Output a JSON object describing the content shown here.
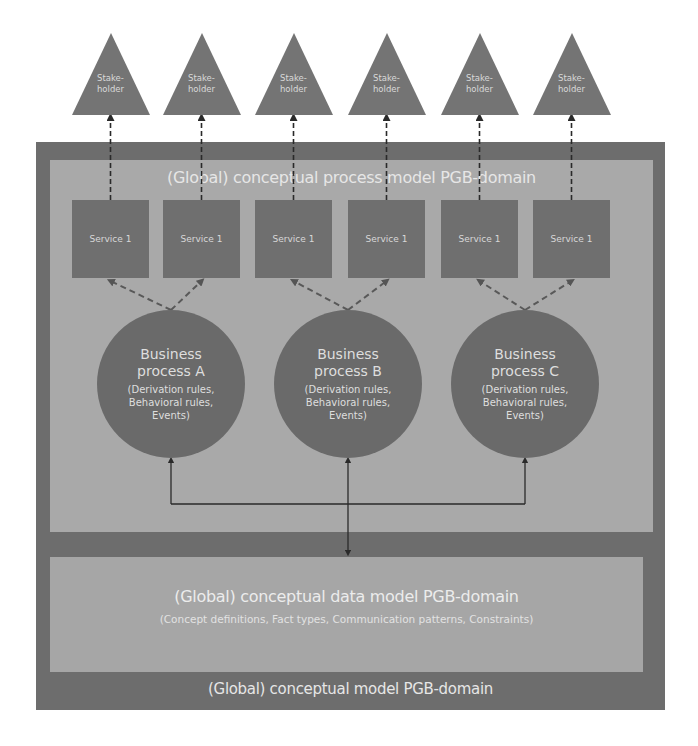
{
  "diagram": {
    "outer_model": {
      "title": "(Global) conceptual model PGB-domain"
    },
    "process_model": {
      "title": "(Global) conceptual process model PGB-domain"
    },
    "data_model": {
      "title": "(Global) conceptual data model PGB-domain",
      "subtitle": "(Concept definitions, Fact types, Communication patterns, Constraints)"
    },
    "stakeholders": [
      {
        "line1": "Stake-",
        "line2": "holder"
      },
      {
        "line1": "Stake-",
        "line2": "holder"
      },
      {
        "line1": "Stake-",
        "line2": "holder"
      },
      {
        "line1": "Stake-",
        "line2": "holder"
      },
      {
        "line1": "Stake-",
        "line2": "holder"
      },
      {
        "line1": "Stake-",
        "line2": "holder"
      }
    ],
    "services": [
      {
        "label": "Service 1"
      },
      {
        "label": "Service 1"
      },
      {
        "label": "Service 1"
      },
      {
        "label": "Service 1"
      },
      {
        "label": "Service 1"
      },
      {
        "label": "Service 1"
      }
    ],
    "processes": [
      {
        "line1": "Business",
        "line2": "process A",
        "details": [
          "(Derivation rules,",
          "Behavioral rules,",
          "Events)"
        ]
      },
      {
        "line1": "Business",
        "line2": "process B",
        "details": [
          "(Derivation rules,",
          "Behavioral rules,",
          "Events)"
        ]
      },
      {
        "line1": "Business",
        "line2": "process C",
        "details": [
          "(Derivation rules,",
          "Behavioral rules,",
          "Events)"
        ]
      }
    ],
    "colors": {
      "outer": "#6d6d6d",
      "inner_panels": "#a9a9a9",
      "shapes": "#6a6a6a",
      "text": "#e6e6e6",
      "connector": "#1a1a1a"
    }
  }
}
